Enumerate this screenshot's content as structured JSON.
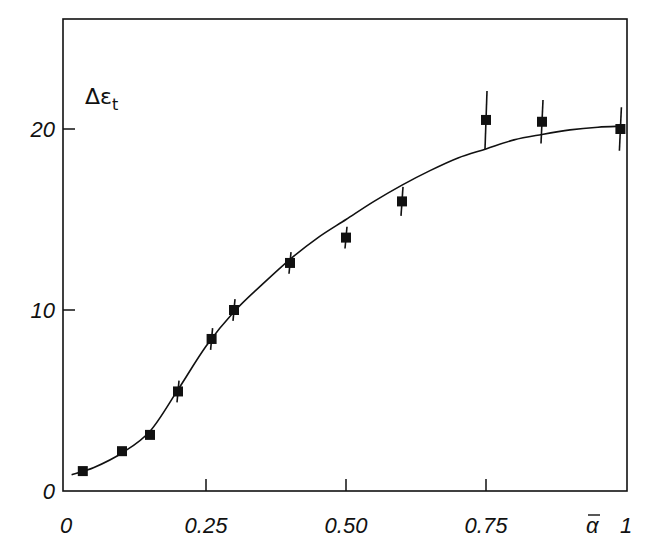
{
  "chart_data": {
    "type": "scatter",
    "title": "",
    "xlabel": "ᾱ",
    "ylabel": "Δε_t",
    "xlim": [
      0,
      1
    ],
    "ylim": [
      0,
      25
    ],
    "grid": false,
    "legend": null,
    "x_ticks": [
      {
        "value": 0,
        "label": "0"
      },
      {
        "value": 0.25,
        "label": "0.25"
      },
      {
        "value": 0.5,
        "label": "0.50"
      },
      {
        "value": 0.75,
        "label": "0.75"
      },
      {
        "value": 1,
        "label": "1"
      }
    ],
    "y_ticks": [
      {
        "value": 0,
        "label": "0"
      },
      {
        "value": 10,
        "label": "10"
      },
      {
        "value": 20,
        "label": "20"
      }
    ],
    "series": [
      {
        "name": "measured",
        "marker": "filled-square",
        "points": [
          {
            "x": 0.03,
            "y": 1.1,
            "err": 0.0
          },
          {
            "x": 0.1,
            "y": 2.2,
            "err": 0.0
          },
          {
            "x": 0.15,
            "y": 3.1,
            "err": 0.0
          },
          {
            "x": 0.2,
            "y": 5.5,
            "err": 0.6
          },
          {
            "x": 0.26,
            "y": 8.4,
            "err": 0.6
          },
          {
            "x": 0.3,
            "y": 10.0,
            "err": 0.6
          },
          {
            "x": 0.4,
            "y": 12.6,
            "err": 0.6
          },
          {
            "x": 0.5,
            "y": 14.0,
            "err": 0.6
          },
          {
            "x": 0.6,
            "y": 16.0,
            "err": 0.8
          },
          {
            "x": 0.75,
            "y": 20.5,
            "err": 1.6
          },
          {
            "x": 0.85,
            "y": 20.4,
            "err": 1.2
          },
          {
            "x": 0.99,
            "y": 20.0,
            "err": 1.2
          }
        ]
      },
      {
        "name": "fit curve",
        "type": "line",
        "points": [
          {
            "x": 0.01,
            "y": 0.9
          },
          {
            "x": 0.05,
            "y": 1.3
          },
          {
            "x": 0.1,
            "y": 2.1
          },
          {
            "x": 0.15,
            "y": 3.3
          },
          {
            "x": 0.2,
            "y": 5.6
          },
          {
            "x": 0.25,
            "y": 8.0
          },
          {
            "x": 0.3,
            "y": 9.9
          },
          {
            "x": 0.35,
            "y": 11.4
          },
          {
            "x": 0.4,
            "y": 12.8
          },
          {
            "x": 0.45,
            "y": 14.0
          },
          {
            "x": 0.5,
            "y": 15.0
          },
          {
            "x": 0.55,
            "y": 16.0
          },
          {
            "x": 0.6,
            "y": 16.9
          },
          {
            "x": 0.65,
            "y": 17.7
          },
          {
            "x": 0.7,
            "y": 18.4
          },
          {
            "x": 0.75,
            "y": 18.9
          },
          {
            "x": 0.8,
            "y": 19.4
          },
          {
            "x": 0.85,
            "y": 19.7
          },
          {
            "x": 0.9,
            "y": 19.95
          },
          {
            "x": 0.95,
            "y": 20.1
          },
          {
            "x": 0.99,
            "y": 20.15
          }
        ]
      }
    ]
  },
  "labels": {
    "y_axis": "Δε",
    "y_axis_sub": "t",
    "x_axis": "α"
  }
}
